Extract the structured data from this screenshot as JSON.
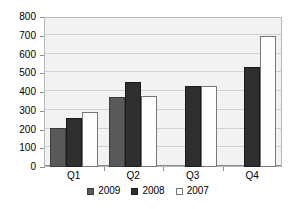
{
  "chart_data": {
    "type": "bar",
    "title": "",
    "subtitle": "",
    "xlabel": "",
    "ylabel": "",
    "categories": [
      "Q1",
      "Q2",
      "Q3",
      "Q4"
    ],
    "ylim": [
      0,
      800
    ],
    "ytick_labels": [
      "800",
      "700",
      "600",
      "500",
      "400",
      "300",
      "200",
      "100",
      "0"
    ],
    "ytick_values": [
      800,
      700,
      600,
      500,
      400,
      300,
      200,
      100,
      0
    ],
    "grid": true,
    "legend_position": "bottom",
    "series": [
      {
        "name": "2009",
        "color": "#595959",
        "values": [
          210,
          373,
          null,
          null
        ]
      },
      {
        "name": "2008",
        "color": "#2f2f2f",
        "values": [
          262,
          455,
          432,
          535
        ]
      },
      {
        "name": "2007",
        "color": "#fdfdfd",
        "values": [
          296,
          378,
          432,
          700
        ]
      }
    ]
  },
  "legend": {
    "items": [
      {
        "label": "2009",
        "swatch": "series-2009"
      },
      {
        "label": "2008",
        "swatch": "series-2008"
      },
      {
        "label": "2007",
        "swatch": "series-2007"
      }
    ]
  }
}
